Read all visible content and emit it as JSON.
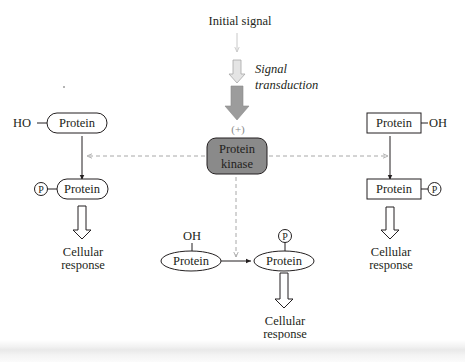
{
  "diagram": {
    "initial_signal": "Initial signal",
    "signal_transduction_line1": "Signal",
    "signal_transduction_line2": "transduction",
    "activation_sign": "(+)",
    "kinase_line1": "Protein",
    "kinase_line2": "kinase",
    "colors": {
      "kinase_fill": "#8a8a8a",
      "transduction_arrow": "#9c9c9c",
      "small_arrow": "#c8c8c8",
      "dashed_arrow": "#a8a8a8",
      "ink": "#231f20"
    },
    "left_branch": {
      "group_label": "HO",
      "protein_before": "Protein",
      "phospho_label": "P",
      "protein_after": "Protein",
      "response_line1": "Cellular",
      "response_line2": "response",
      "shape": "rounded-capsule"
    },
    "center_branch": {
      "group_label": "OH",
      "protein_before": "Protein",
      "phospho_label": "P",
      "protein_after": "Protein",
      "response_line1": "Cellular",
      "response_line2": "response",
      "shape": "ellipse"
    },
    "right_branch": {
      "group_label": "OH",
      "protein_before": "Protein",
      "phospho_label": "P",
      "protein_after": "Protein",
      "response_line1": "Cellular",
      "response_line2": "response",
      "shape": "rectangle"
    }
  }
}
